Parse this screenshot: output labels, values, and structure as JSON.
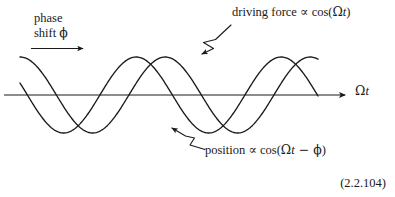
{
  "figure": {
    "title": "",
    "equation_number": "(2.2.104)",
    "background_color": "#ffffff",
    "ink_color": "#1a1a1a"
  },
  "annotations": {
    "phase_shift": {
      "line1": "phase",
      "line2_prefix": "shift ",
      "line2_symbol": "ϕ"
    },
    "driving_force": {
      "text_prefix": "driving force ",
      "proportional": "∝",
      "func": " cos(",
      "omega": "Ω",
      "t": "t",
      "close": ")"
    },
    "position": {
      "text_prefix": "position ",
      "proportional": "∝",
      "func": " cos(",
      "omega": "Ω",
      "t": "t",
      "minus": " − ",
      "phi": "ϕ",
      "close": ")"
    },
    "axis": {
      "omega": "Ω",
      "t": "t"
    }
  },
  "chart_data": {
    "type": "line",
    "title": "",
    "xlabel": "Ωt",
    "ylabel": "",
    "grid": false,
    "legend": "annotations",
    "xlim": [
      0,
      6.6
    ],
    "ylim": [
      -1.15,
      1.15
    ],
    "axis_y_value": 0,
    "series": [
      {
        "name": "driving force ∝ cos(Ωt)",
        "formula": "cos(x)",
        "amplitude": 1,
        "phase_shift_rad": 0,
        "color": "#1a1a1a",
        "x": [
          0,
          0.3,
          0.6,
          0.9,
          1.2,
          1.5,
          1.8,
          2.1,
          2.4,
          2.7,
          3.0,
          3.3,
          3.6,
          3.9,
          4.2,
          4.5,
          4.8,
          5.1,
          5.4,
          5.7,
          6.0,
          6.3
        ],
        "y": [
          1.0,
          0.955,
          0.825,
          0.622,
          0.362,
          0.071,
          -0.227,
          -0.505,
          -0.737,
          -0.904,
          -0.99,
          -0.987,
          -0.896,
          -0.726,
          -0.49,
          -0.211,
          0.087,
          0.378,
          0.635,
          0.834,
          0.96,
          1.0
        ]
      },
      {
        "name": "position ∝ cos(Ωt − ϕ)",
        "formula": "cos(x - phi)",
        "amplitude": 1,
        "phase_shift_rad": 1.2566,
        "color": "#1a1a1a",
        "x": [
          0,
          0.3,
          0.6,
          0.9,
          1.2,
          1.5,
          1.8,
          2.1,
          2.4,
          2.7,
          3.0,
          3.3,
          3.6,
          3.9,
          4.2,
          4.5,
          4.8,
          5.1,
          5.4,
          5.7,
          6.0,
          6.3
        ],
        "y": [
          0.309,
          0.637,
          0.876,
          0.998,
          0.991,
          0.858,
          0.618,
          0.304,
          -0.045,
          -0.386,
          -0.677,
          -0.885,
          -0.987,
          -0.973,
          -0.844,
          -0.615,
          -0.309,
          0.041,
          0.383,
          0.675,
          0.884,
          0.987
        ]
      }
    ],
    "markers": {
      "phase_shift_arrow": {
        "from_x": 0.16,
        "to_x": 1.35,
        "y": 1.48,
        "label": "phase shift ϕ"
      }
    }
  }
}
